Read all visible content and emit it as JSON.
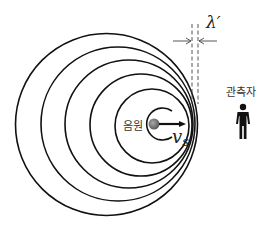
{
  "diagram": {
    "type": "doppler-effect-wavefronts",
    "source_label": "음원",
    "observer_label": "관측자",
    "velocity_label": "v",
    "velocity_subscript": "s",
    "wavelength_label": "λ′",
    "colors": {
      "lines": "#111111",
      "source_dot": "#7a7a7a",
      "text": "#333333",
      "background": "#ffffff"
    },
    "wavefronts": [
      {
        "cx": 106.5,
        "cy": 124.5,
        "r": 91
      },
      {
        "cx": 118,
        "cy": 124,
        "r": 77
      },
      {
        "cx": 129,
        "cy": 124,
        "r": 64
      },
      {
        "cx": 141,
        "cy": 125,
        "r": 51
      },
      {
        "cx": 152,
        "cy": 126,
        "r": 37
      },
      {
        "cx": 156,
        "cy": 124,
        "r": 16
      }
    ]
  }
}
